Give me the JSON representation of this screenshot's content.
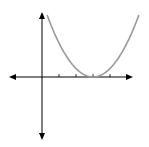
{
  "chart_data": {
    "type": "line",
    "title": "",
    "xlabel": "",
    "ylabel": "",
    "function": "y = 0.5 * (x - 3)^2",
    "series": [
      {
        "name": "parabola",
        "x": [
          0.3,
          1,
          2,
          3,
          4,
          5,
          5.7
        ],
        "values": [
          3.65,
          2,
          0.5,
          0,
          0.5,
          2,
          3.65
        ]
      }
    ],
    "vertex": [
      3,
      0
    ],
    "x_ticks": [
      1,
      2,
      3,
      4
    ],
    "tick_labels": [],
    "xlim": [
      -2,
      5.5
    ],
    "ylim": [
      -3.6,
      3.8
    ],
    "grid": false,
    "axes_arrows": true,
    "colors": {
      "axes": "#000000",
      "curve": "#999999"
    }
  }
}
